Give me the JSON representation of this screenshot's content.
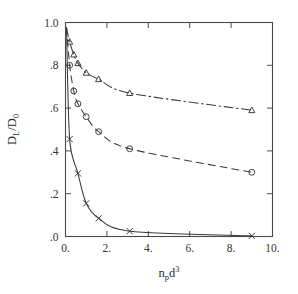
{
  "figure": {
    "background_color": "#ffffff",
    "line_color": "#3a3a3a",
    "axis_color": "#4a4a4a",
    "text_color": "#333333"
  },
  "axes": {
    "x_title_main": "n",
    "x_title_sub": "p",
    "x_title_tail": "d",
    "x_title_sup": "3",
    "y_title_main": "D",
    "y_title_sub": "L",
    "y_title_slash": "/D",
    "y_title_sub2": "0",
    "x_ticklabels": [
      "0.",
      "2.",
      "4.",
      "6.",
      "8.",
      "10."
    ],
    "x_tickvalues": [
      0,
      2,
      4,
      6,
      8,
      10
    ],
    "y_ticklabels": [
      "1.0",
      ".8",
      ".6",
      ".4",
      ".2",
      ".0"
    ],
    "y_tickvalues": [
      1.0,
      0.8,
      0.6,
      0.4,
      0.2,
      0.0
    ]
  },
  "chart_data": {
    "type": "line",
    "title": "",
    "xlabel": "n_p d^3",
    "ylabel": "D_L/D_0",
    "xlim": [
      0,
      10
    ],
    "ylim": [
      0,
      1.0
    ],
    "grid": false,
    "legend": "none",
    "tick_direction": "in",
    "frame": "box",
    "series": [
      {
        "name": "upper",
        "marker": "triangle-up",
        "linestyle": "dash-dot",
        "x": [
          0.05,
          0.2,
          0.4,
          0.6,
          1.0,
          1.6,
          3.1,
          9.0
        ],
        "y": [
          0.975,
          0.91,
          0.85,
          0.81,
          0.765,
          0.735,
          0.67,
          0.59
        ]
      },
      {
        "name": "middle",
        "marker": "circle",
        "linestyle": "dashed",
        "x": [
          0.05,
          0.2,
          0.4,
          0.6,
          1.0,
          1.6,
          3.1,
          9.0
        ],
        "y": [
          0.975,
          0.8,
          0.68,
          0.62,
          0.56,
          0.49,
          0.41,
          0.3
        ]
      },
      {
        "name": "lower",
        "marker": "x",
        "linestyle": "solid",
        "x": [
          0.05,
          0.2,
          0.6,
          1.0,
          1.6,
          3.1,
          9.0
        ],
        "y": [
          0.975,
          0.455,
          0.295,
          0.155,
          0.085,
          0.025,
          0.003
        ]
      }
    ]
  }
}
